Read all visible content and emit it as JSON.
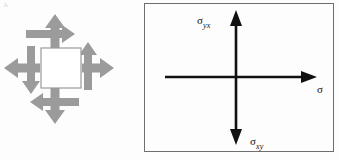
{
  "figure": {
    "corner_mark": "A",
    "background_color": "#fdfdfd"
  },
  "stress_element": {
    "name": "stress-element-diagram",
    "square": {
      "fill_color": "#ffffff",
      "stroke_color": "#9a9a9a",
      "x": 41,
      "y": 42,
      "width": 40,
      "height": 40
    },
    "arrow_color": "#9b9b9b",
    "arrows": [
      {
        "name": "normal-stress-arrow-up",
        "direction": "up",
        "type": "normal"
      },
      {
        "name": "normal-stress-arrow-down",
        "direction": "down",
        "type": "normal"
      },
      {
        "name": "normal-stress-arrow-left",
        "direction": "left",
        "type": "normal"
      },
      {
        "name": "normal-stress-arrow-right",
        "direction": "right",
        "type": "normal"
      },
      {
        "name": "shear-stress-arrow-top",
        "direction": "right",
        "type": "shear"
      },
      {
        "name": "shear-stress-arrow-bottom",
        "direction": "left",
        "type": "shear"
      },
      {
        "name": "shear-stress-arrow-left",
        "direction": "down",
        "type": "shear"
      },
      {
        "name": "shear-stress-arrow-right",
        "direction": "up",
        "type": "shear"
      }
    ]
  },
  "axes_panel": {
    "name": "stress-axes-panel",
    "border_color": "#6f6f6f",
    "axis_color": "#111111",
    "axes": [
      {
        "name": "vertical-axis",
        "orientation": "vertical",
        "arrowheads": "both"
      },
      {
        "name": "horizontal-axis",
        "orientation": "horizontal",
        "arrowheads": "right"
      }
    ],
    "labels": {
      "top": {
        "symbol": "σ",
        "subscript": "yx"
      },
      "bottom": {
        "symbol": "σ",
        "subscript": "xy"
      },
      "right": {
        "symbol": "σ",
        "subscript": ""
      }
    }
  }
}
